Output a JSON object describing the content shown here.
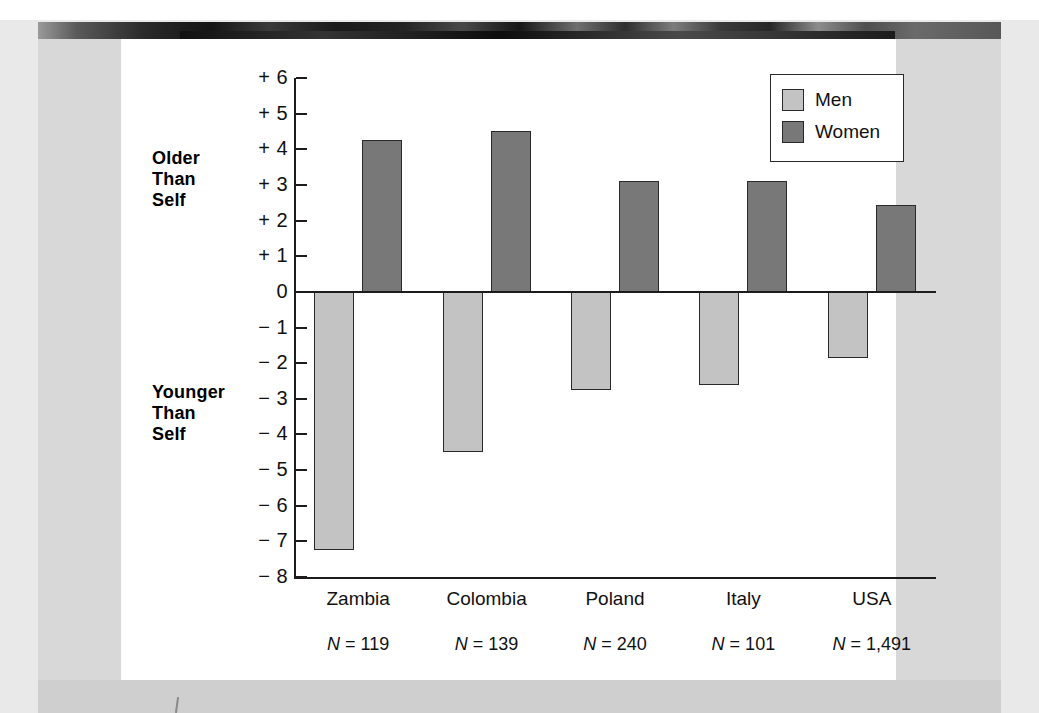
{
  "chart_data": {
    "type": "bar",
    "title": "",
    "xlabel": "",
    "ylabel": "",
    "ylim": [
      -8,
      6
    ],
    "grid": false,
    "legend_position": "top-right",
    "categories": [
      "Zambia",
      "Colombia",
      "Poland",
      "Italy",
      "USA"
    ],
    "series": [
      {
        "name": "Men",
        "color": "#c3c3c3",
        "values": [
          -7.25,
          -4.5,
          -2.75,
          -2.6,
          -1.85
        ]
      },
      {
        "name": "Women",
        "color": "#787878",
        "values": [
          4.25,
          4.5,
          3.1,
          3.1,
          2.45
        ]
      }
    ],
    "y_tick_labels": [
      "+ 6",
      "+ 5",
      "+ 4",
      "+ 3",
      "+ 2",
      "+ 1",
      "0",
      "− 1",
      "− 2",
      "− 3",
      "− 4",
      "− 5",
      "− 6",
      "− 7",
      "− 8"
    ],
    "y_tick_values": [
      6,
      5,
      4,
      3,
      2,
      1,
      0,
      -1,
      -2,
      -3,
      -4,
      -5,
      -6,
      -7,
      -8
    ],
    "sample_sizes": [
      {
        "category": "Zambia",
        "prefix": "N",
        "text": " = 119"
      },
      {
        "category": "Colombia",
        "prefix": "N",
        "text": " = 139"
      },
      {
        "category": "Poland",
        "prefix": "N",
        "text": " = 240"
      },
      {
        "category": "Italy",
        "prefix": "N",
        "text": " = 101"
      },
      {
        "category": "USA",
        "prefix": "N",
        "text": " = 1,491"
      }
    ],
    "annotations": {
      "positive_direction": "Older\nThan\nSelf",
      "negative_direction": "Younger\nThan\nSelf"
    }
  },
  "annotations": {
    "older_line1": "Older",
    "older_line2": "Than",
    "older_line3": "Self",
    "younger_line1": "Younger",
    "younger_line2": "Than",
    "younger_line3": "Self"
  },
  "legend": {
    "men_label": "Men",
    "women_label": "Women"
  }
}
